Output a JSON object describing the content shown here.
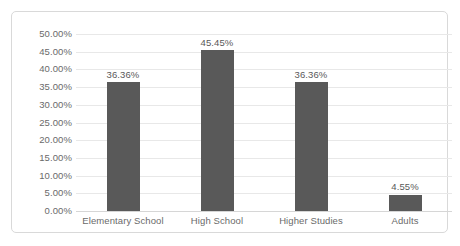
{
  "chart_data": {
    "type": "bar",
    "title": "",
    "subtitle": "",
    "xlabel": "",
    "ylabel": "",
    "categories": [
      "Elementary School",
      "High School",
      "Higher Studies",
      "Adults"
    ],
    "values": [
      36.36,
      45.45,
      36.36,
      4.55
    ],
    "value_labels": [
      "36.36%",
      "45.45%",
      "36.36%",
      "4.55%"
    ],
    "ylim": [
      0,
      50
    ],
    "ytick_step": 5,
    "ytick_labels": [
      "50.00%",
      "45.00%",
      "40.00%",
      "35.00%",
      "30.00%",
      "25.00%",
      "20.00%",
      "15.00%",
      "10.00%",
      "5.00%",
      "0.00%"
    ],
    "ytick_values": [
      50,
      45,
      40,
      35,
      30,
      25,
      20,
      15,
      10,
      5,
      0
    ],
    "grid": true,
    "grid_axis": "y",
    "legend": false,
    "legend_position": "none",
    "data_labels": true,
    "series": [
      {
        "name": "",
        "values": [
          36.36,
          45.45,
          36.36,
          4.55
        ]
      }
    ],
    "colors": {
      "bar": "#595959",
      "gridline": "#e8e8e8",
      "axis": "#d6d6d6",
      "border": "#d9d9d9",
      "tick_label": "#6a6a6a",
      "data_label": "#595959",
      "background": "#ffffff"
    }
  }
}
